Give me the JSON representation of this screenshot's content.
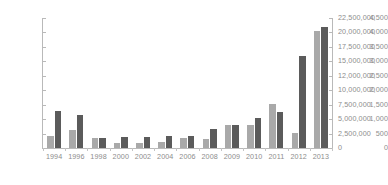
{
  "chart_data": {
    "type": "bar",
    "title": "",
    "subtitle": "",
    "xlabel": "",
    "ylabel": "",
    "y2label": "",
    "grid": false,
    "legend": "none",
    "categories": [
      "1994",
      "1996",
      "1998",
      "2000",
      "2002",
      "2004",
      "2006",
      "2008",
      "2009",
      "2010",
      "2011",
      "2012",
      "2013"
    ],
    "axes": {
      "left": {
        "min": 0,
        "max": 4500,
        "step": 500,
        "ticks": [
          "0",
          "500",
          "1,000",
          "1,500",
          "2,000",
          "2,500",
          "3,000",
          "3,500",
          "4,000",
          "4,500"
        ],
        "tick_values": [
          0,
          500,
          1000,
          1500,
          2000,
          2500,
          3000,
          3500,
          4000,
          4500
        ]
      },
      "right": {
        "min": 0,
        "max": 22500000,
        "step": 2500000,
        "ticks": [
          "0",
          "2,500,000",
          "5,000,000",
          "7,500,000",
          "10,000,000",
          "12,000,000",
          "15,000,000",
          "17,500,000",
          "20,000,000",
          "22,500,000"
        ],
        "tick_values": [
          0,
          2500000,
          5000000,
          7500000,
          10000000,
          12000000,
          15000000,
          17500000,
          20000000,
          22500000
        ]
      }
    },
    "series": [
      {
        "name": "series-light",
        "color": "#a9a9a9",
        "axis": "left",
        "values": [
          400,
          620,
          360,
          190,
          170,
          200,
          330,
          310,
          790,
          800,
          1510,
          530,
          4050
        ]
      },
      {
        "name": "series-dark",
        "color": "#5b5b5b",
        "axis": "right",
        "values": [
          1270,
          1150,
          340,
          370,
          370,
          420,
          420,
          660,
          790,
          1030,
          1240,
          3180,
          4200
        ]
      }
    ]
  },
  "colors": {
    "light_bar": "#a9a9a9",
    "dark_bar": "#5b5b5b",
    "axis": "#b9b9b9",
    "text": "#8d8d8d",
    "background": "#ffffff"
  }
}
